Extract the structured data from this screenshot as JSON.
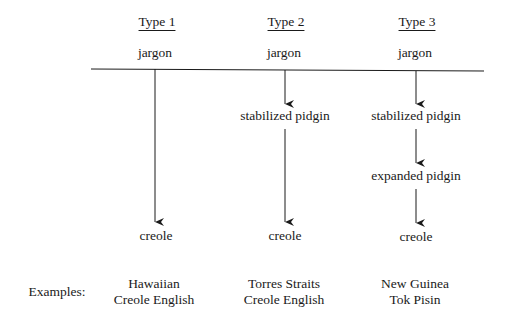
{
  "columns": [
    {
      "header": "Type 1",
      "stages": [
        "jargon",
        "creole"
      ],
      "example": [
        "Hawaiian",
        "Creole English"
      ]
    },
    {
      "header": "Type 2",
      "stages": [
        "jargon",
        "stabilized pidgin",
        "creole"
      ],
      "example": [
        "Torres Straits",
        "Creole English"
      ]
    },
    {
      "header": "Type 3",
      "stages": [
        "jargon",
        "stabilized pidgin",
        "expanded pidgin",
        "creole"
      ],
      "example": [
        "New Guinea",
        "Tok Pisin"
      ]
    }
  ],
  "examples_label": "Examples:",
  "colors": {
    "ink": "#1a1a1a",
    "background": "#ffffff"
  }
}
